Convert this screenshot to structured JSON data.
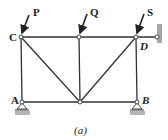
{
  "figure": {
    "caption": "(a)",
    "nodes": {
      "C": {
        "label": "C",
        "x": 21,
        "y": 37
      },
      "top_mid": {
        "label": "",
        "x": 79,
        "y": 37
      },
      "D": {
        "label": "D",
        "x": 136,
        "y": 37
      },
      "wall_pin": {
        "label": "",
        "x": 157,
        "y": 37
      },
      "A": {
        "label": "A",
        "x": 22,
        "y": 102
      },
      "bottom_mid": {
        "label": "",
        "x": 80,
        "y": 102
      },
      "B": {
        "label": "B",
        "x": 137,
        "y": 102
      }
    },
    "loads": [
      {
        "label": "P",
        "at": "C"
      },
      {
        "label": "Q",
        "at": "top_mid"
      },
      {
        "label": "S",
        "at": "D"
      }
    ],
    "supports": [
      {
        "at": "A",
        "type": "roller"
      },
      {
        "at": "B",
        "type": "roller"
      },
      {
        "at": "wall_pin",
        "type": "wall-link"
      }
    ],
    "colors": {
      "member": "#333333",
      "support_fill": "#b5b5b5",
      "wall_fill": "#a8a8a8"
    }
  }
}
